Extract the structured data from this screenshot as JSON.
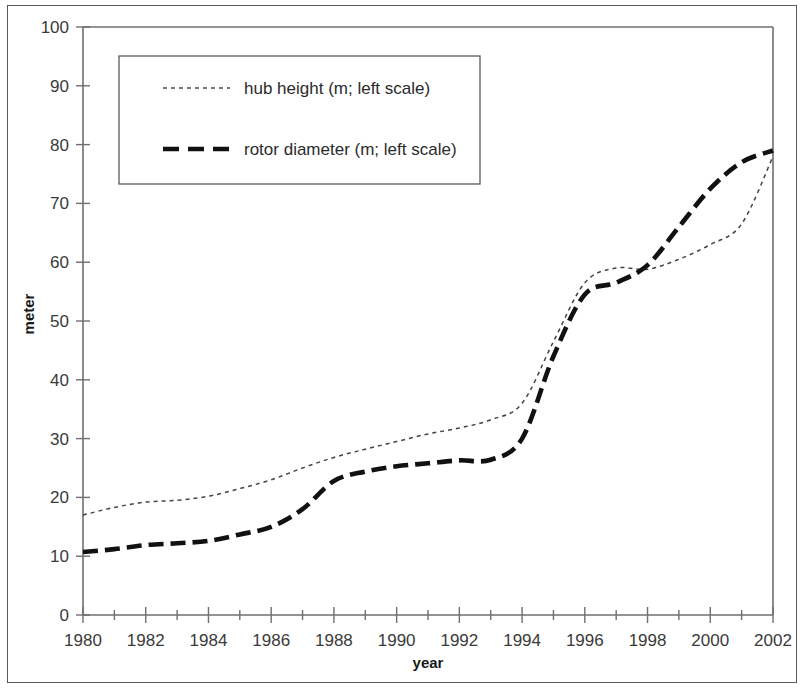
{
  "chart_data": {
    "type": "line",
    "title": "",
    "xlabel": "year",
    "ylabel": "meter",
    "xlim": [
      1980,
      2002
    ],
    "ylim": [
      0,
      100
    ],
    "grid": false,
    "legend_position": "upper-left-inside",
    "x_tick_labels": [
      "1980",
      "1982",
      "1984",
      "1986",
      "1988",
      "1990",
      "1992",
      "1994",
      "1996",
      "1998",
      "2000",
      "2002"
    ],
    "x_ticks": [
      1980,
      1982,
      1984,
      1986,
      1988,
      1990,
      1992,
      1994,
      1996,
      1998,
      2000,
      2002
    ],
    "x_minor_ticks": [
      1981,
      1983,
      1985,
      1987,
      1989,
      1991,
      1993,
      1995,
      1997,
      1999,
      2001
    ],
    "y_tick_labels": [
      "0",
      "10",
      "20",
      "30",
      "40",
      "50",
      "60",
      "70",
      "80",
      "90",
      "100"
    ],
    "y_ticks": [
      0,
      10,
      20,
      30,
      40,
      50,
      60,
      70,
      80,
      90,
      100
    ],
    "x": [
      1980,
      1981,
      1982,
      1983,
      1984,
      1985,
      1986,
      1987,
      1988,
      1989,
      1990,
      1991,
      1992,
      1993,
      1994,
      1995,
      1996,
      1997,
      1998,
      1999,
      2000,
      2001,
      2002
    ],
    "series": [
      {
        "name": "hub height (m; left scale)",
        "style": "dotted-thin",
        "values": [
          17.0,
          18.3,
          19.2,
          19.5,
          20.2,
          21.5,
          23.0,
          25.0,
          26.8,
          28.2,
          29.5,
          30.8,
          31.8,
          33.2,
          36.0,
          46.5,
          56.5,
          59.0,
          58.8,
          60.5,
          63.0,
          66.5,
          78.0
        ]
      },
      {
        "name": "rotor diameter (m; left scale)",
        "style": "dashed-thick",
        "values": [
          10.7,
          11.2,
          11.9,
          12.2,
          12.6,
          13.7,
          15.0,
          18.0,
          22.8,
          24.4,
          25.3,
          25.8,
          26.3,
          26.4,
          30.0,
          44.0,
          54.5,
          56.5,
          59.5,
          66.0,
          72.5,
          77.0,
          79.0
        ]
      }
    ],
    "legend": [
      {
        "label": "hub height (m; left scale)",
        "style": "dotted-thin"
      },
      {
        "label": "rotor diameter (m; left scale)",
        "style": "dashed-thick"
      }
    ],
    "colors": {
      "hub_height": "#444444",
      "rotor_diameter": "#111111",
      "axis": "#6f6f6f",
      "text": "#2b2b2b",
      "background": "#ffffff"
    }
  }
}
